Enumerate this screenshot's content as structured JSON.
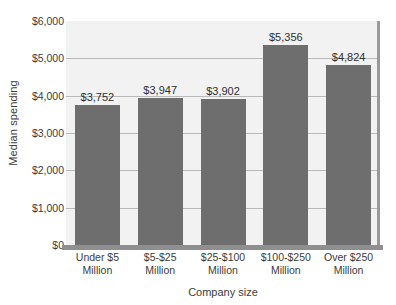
{
  "chart_data": {
    "type": "bar",
    "title": "",
    "xlabel": "Company size",
    "ylabel": "Median spending",
    "categories": [
      "Under $5 Million",
      "$5-$25 Million",
      "$25-$100 Million",
      "$100-$250 Million",
      "Over $250 Million"
    ],
    "category_lines": [
      [
        "Under $5",
        "Million"
      ],
      [
        "$5-$25",
        "Million"
      ],
      [
        "$25-$100",
        "Million"
      ],
      [
        "$100-$250",
        "Million"
      ],
      [
        "Over $250",
        "Million"
      ]
    ],
    "values": [
      3752,
      3947,
      3902,
      5356,
      4824
    ],
    "value_labels": [
      "$3,752",
      "$3,947",
      "$3,902",
      "$5,356",
      "$4,824"
    ],
    "ylim": [
      0,
      6000
    ],
    "ytick_values": [
      0,
      1000,
      2000,
      3000,
      4000,
      5000,
      6000
    ],
    "ytick_labels": [
      "$0",
      "$1,000",
      "$2,000",
      "$3,000",
      "$4,000",
      "$5,000",
      "$6,000"
    ],
    "grid": true,
    "legend": false,
    "bar_color": "#6e6e6e",
    "plot_background": "#f2f2f2",
    "gridline_color": "#b9b9b9",
    "axis_color": "#8f8f8f"
  }
}
